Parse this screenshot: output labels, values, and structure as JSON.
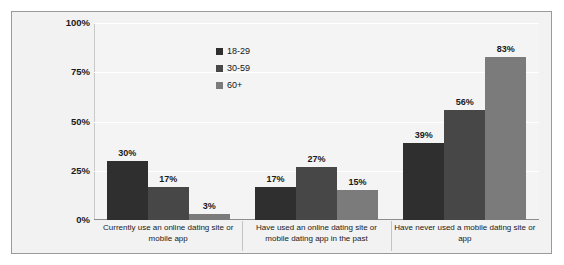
{
  "chart_data": {
    "type": "bar",
    "title": "",
    "subtitle": "",
    "xlabel": "",
    "ylabel": "",
    "ylim": [
      0,
      100
    ],
    "yticks": [
      "0%",
      "25%",
      "50%",
      "75%",
      "100%"
    ],
    "ytick_values": [
      0,
      25,
      50,
      75,
      100
    ],
    "grid": true,
    "legend_position": "top-left-inside",
    "categories": [
      "Currently use an online dating site or mobile app",
      "Have used an online dating site or mobile dating app in the past",
      "Have never used a mobile dating site or app"
    ],
    "series": [
      {
        "name": "18-29",
        "color": "#2f2f2f",
        "values": [
          30,
          17,
          39
        ],
        "labels": [
          "30%",
          "17%",
          "39%"
        ]
      },
      {
        "name": "30-59",
        "color": "#474747",
        "values": [
          17,
          27,
          56
        ],
        "labels": [
          "17%",
          "27%",
          "56%"
        ]
      },
      {
        "name": "60+",
        "color": "#7b7b7b",
        "values": [
          3,
          15,
          83
        ],
        "labels": [
          "3%",
          "15%",
          "83%"
        ]
      }
    ]
  }
}
